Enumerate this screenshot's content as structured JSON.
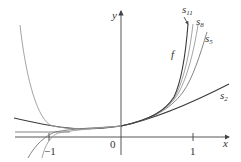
{
  "diagram": {
    "axes": {
      "x_label": "x",
      "y_label": "y",
      "origin_label": "0",
      "ticks": [
        {
          "value": -1,
          "label": "−1"
        },
        {
          "value": 1,
          "label": "1"
        }
      ]
    },
    "curves": [
      {
        "name": "f",
        "label": "f"
      },
      {
        "name": "s11",
        "label": "s",
        "subscript": "11"
      },
      {
        "name": "s8",
        "label": "s",
        "subscript": "8"
      },
      {
        "name": "s5",
        "label": "s",
        "subscript": "5"
      },
      {
        "name": "s2",
        "label": "s",
        "subscript": "2"
      }
    ],
    "colors": {
      "axis": "#444444",
      "dark_curve": "#3a3a3a",
      "light_curve": "#9a9a9a"
    }
  }
}
